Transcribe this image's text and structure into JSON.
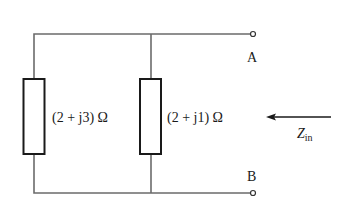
{
  "diagram": {
    "type": "circuit",
    "components": [
      {
        "id": "Z1",
        "kind": "impedance",
        "label": "(2 + j3) Ω"
      },
      {
        "id": "Z2",
        "kind": "impedance",
        "label": "(2 + j1) Ω"
      }
    ],
    "terminals": [
      {
        "id": "A",
        "label": "A"
      },
      {
        "id": "B",
        "label": "B"
      }
    ],
    "input_impedance": {
      "symbol": "Z",
      "subscript": "in"
    },
    "colors": {
      "wire": "#6b6b6b",
      "component": "#1a1a1a",
      "background": "#ffffff"
    }
  }
}
